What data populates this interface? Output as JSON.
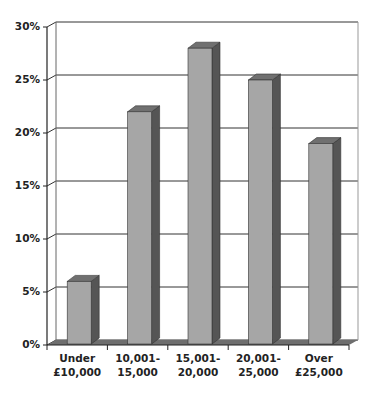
{
  "chart_data": {
    "type": "bar",
    "style": "3d-column",
    "title": "",
    "xlabel": "",
    "ylabel": "",
    "categories": [
      "Under £10,000",
      "10,001-15,000",
      "15,001-20,000",
      "20,001-25,000",
      "Over £25,000"
    ],
    "category_lines": [
      [
        "Under",
        "£10,000"
      ],
      [
        "10,001-",
        "15,000"
      ],
      [
        "15,001-",
        "20,000"
      ],
      [
        "20,001-",
        "25,000"
      ],
      [
        "Over",
        "£25,000"
      ]
    ],
    "values": [
      6,
      22,
      28,
      25,
      19
    ],
    "ylim": [
      0,
      30
    ],
    "yticks": [
      "0%",
      "5%",
      "10%",
      "15%",
      "20%",
      "25%",
      "30%"
    ],
    "grid": true,
    "legend": "none",
    "colors": {
      "bar_front": "#a6a6a6",
      "bar_side": "#555555",
      "bar_top": "#707070",
      "floor": "#6e6e6e",
      "grid": "#333333"
    }
  }
}
